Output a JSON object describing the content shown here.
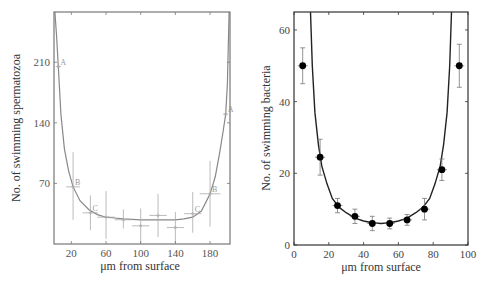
{
  "chart_data": [
    {
      "type": "scatter",
      "panel": "left",
      "title": "",
      "xlabel": "μm from surface",
      "ylabel": "No. of swimming spermatozoa",
      "xlim": [
        0,
        203
      ],
      "ylim": [
        0,
        268
      ],
      "xticks": [
        20,
        60,
        100,
        140,
        180
      ],
      "yticks": [
        70,
        140,
        210
      ],
      "grid": false,
      "legend": null,
      "colors": {
        "frame": "#777777",
        "points": "#aaaaaa",
        "curve": "#888888"
      },
      "series": [
        {
          "name": "observed",
          "points": [
            {
              "x": 5,
              "y": 205,
              "xerr": 3,
              "yerr_low": 0,
              "yerr_high": 0,
              "label": "A"
            },
            {
              "x": 22,
              "y": 66,
              "xerr": 8,
              "yerr_low": 38,
              "yerr_high": 40,
              "label": "B"
            },
            {
              "x": 42,
              "y": 36,
              "xerr": 9,
              "yerr_low": 20,
              "yerr_high": 20,
              "label": "C"
            },
            {
              "x": 60,
              "y": 31,
              "xerr": 10,
              "yerr_low": 25,
              "yerr_high": 30,
              "label": ""
            },
            {
              "x": 80,
              "y": 28,
              "xerr": 10,
              "yerr_low": 10,
              "yerr_high": 12,
              "label": ""
            },
            {
              "x": 100,
              "y": 21,
              "xerr": 10,
              "yerr_low": 20,
              "yerr_high": 20,
              "label": ""
            },
            {
              "x": 120,
              "y": 33,
              "xerr": 10,
              "yerr_low": 25,
              "yerr_high": 25,
              "label": ""
            },
            {
              "x": 140,
              "y": 19,
              "xerr": 10,
              "yerr_low": 18,
              "yerr_high": 18,
              "label": ""
            },
            {
              "x": 160,
              "y": 35,
              "xerr": 10,
              "yerr_low": 22,
              "yerr_high": 25,
              "label": "C"
            },
            {
              "x": 180,
              "y": 58,
              "xerr": 12,
              "yerr_low": 38,
              "yerr_high": 38,
              "label": "B"
            },
            {
              "x": 198,
              "y": 150,
              "xerr": 3,
              "yerr_low": 0,
              "yerr_high": 0,
              "label": "A"
            }
          ]
        },
        {
          "name": "fit curve",
          "type": "line",
          "x": [
            1,
            3,
            5,
            8,
            12,
            17,
            22,
            30,
            40,
            50,
            60,
            70,
            80,
            100,
            120,
            140,
            150,
            160,
            170,
            180,
            186,
            191,
            195,
            198,
            200,
            202
          ],
          "y": [
            268,
            240,
            205,
            150,
            110,
            84,
            66,
            50,
            40,
            34,
            31,
            30,
            29,
            28,
            28,
            28,
            29,
            31,
            38,
            58,
            78,
            105,
            130,
            150,
            185,
            268
          ]
        }
      ]
    },
    {
      "type": "scatter",
      "panel": "right",
      "title": "",
      "xlabel": "μm from surface",
      "ylabel": "No. of swimming bacteria",
      "xlim": [
        0,
        100
      ],
      "ylim": [
        0,
        65
      ],
      "xticks": [
        0,
        20,
        40,
        60,
        80,
        100
      ],
      "yticks": [
        0,
        20,
        40,
        60
      ],
      "grid": false,
      "legend": null,
      "colors": {
        "frame": "#333333",
        "points": "#000000",
        "curve": "#222222"
      },
      "series": [
        {
          "name": "observed",
          "points": [
            {
              "x": 5,
              "y": 50,
              "yerr": 5
            },
            {
              "x": 15,
              "y": 24.5,
              "yerr": 5
            },
            {
              "x": 25,
              "y": 11,
              "yerr": 2
            },
            {
              "x": 35,
              "y": 8,
              "yerr": 2
            },
            {
              "x": 45,
              "y": 6,
              "yerr": 2
            },
            {
              "x": 55,
              "y": 6,
              "yerr": 1.5
            },
            {
              "x": 65,
              "y": 7,
              "yerr": 1.5
            },
            {
              "x": 75,
              "y": 10,
              "yerr": 3
            },
            {
              "x": 85,
              "y": 21,
              "yerr": 3
            },
            {
              "x": 95,
              "y": 50,
              "yerr": 6
            }
          ]
        },
        {
          "name": "fit curve",
          "type": "line",
          "x": [
            9.5,
            10.5,
            12,
            14,
            16,
            19,
            22,
            26,
            30,
            35,
            40,
            45,
            50,
            55,
            60,
            65,
            70,
            74,
            78,
            81,
            84,
            86,
            88,
            89.5,
            90.5
          ],
          "y": [
            65,
            50,
            37,
            28,
            22,
            17,
            13,
            10.5,
            9,
            7.5,
            6.7,
            6.2,
            6.0,
            6.2,
            6.7,
            7.5,
            9,
            10.5,
            13,
            17,
            22,
            28,
            37,
            50,
            65
          ]
        }
      ]
    }
  ],
  "left": {
    "ylabel": "No. of swimming spermatozoa",
    "xlabel": "μm from surface",
    "yticks": [
      "210",
      "140",
      "70"
    ],
    "xticks": [
      "20",
      "60",
      "100",
      "140",
      "180"
    ]
  },
  "right": {
    "ylabel": "No. of swimming bacteria",
    "xlabel": "μm from surface",
    "yticks": [
      "60",
      "40",
      "20",
      "0"
    ],
    "xticks": [
      "0",
      "20",
      "40",
      "60",
      "80",
      "100"
    ]
  }
}
